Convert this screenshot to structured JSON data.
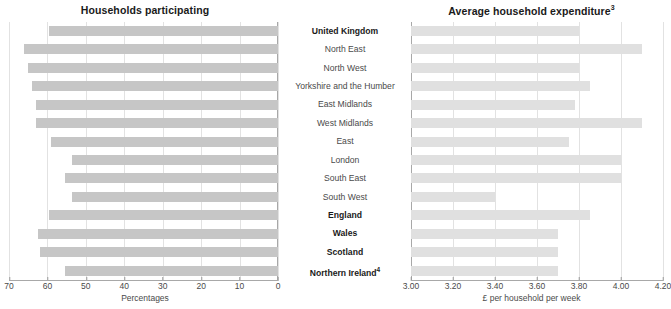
{
  "left_chart": {
    "title": "Households participating",
    "axis_caption": "Percentages",
    "ticks": [
      "70",
      "60",
      "50",
      "40",
      "30",
      "20",
      "10",
      "0"
    ]
  },
  "right_chart": {
    "title": "Average household expenditure",
    "title_sup": "3",
    "axis_caption": "£ per household per week",
    "ticks": [
      "3.00",
      "3.20",
      "3.40",
      "3.60",
      "3.80",
      "4.00",
      "4.20"
    ]
  },
  "categories": [
    {
      "label": "United Kingdom",
      "bold": true,
      "sup": ""
    },
    {
      "label": "North East",
      "bold": false,
      "sup": ""
    },
    {
      "label": "North West",
      "bold": false,
      "sup": ""
    },
    {
      "label": "Yorkshire and the Humber",
      "bold": false,
      "sup": ""
    },
    {
      "label": "East Midlands",
      "bold": false,
      "sup": ""
    },
    {
      "label": "West Midlands",
      "bold": false,
      "sup": ""
    },
    {
      "label": "East",
      "bold": false,
      "sup": ""
    },
    {
      "label": "London",
      "bold": false,
      "sup": ""
    },
    {
      "label": "South East",
      "bold": false,
      "sup": ""
    },
    {
      "label": "South West",
      "bold": false,
      "sup": ""
    },
    {
      "label": "England",
      "bold": true,
      "sup": ""
    },
    {
      "label": "Wales",
      "bold": true,
      "sup": ""
    },
    {
      "label": "Scotland",
      "bold": true,
      "sup": ""
    },
    {
      "label": "Northern Ireland",
      "bold": true,
      "sup": "4"
    }
  ],
  "chart_data": [
    {
      "type": "bar",
      "title": "Households participating",
      "orientation": "horizontal-reversed",
      "xlabel": "Percentages",
      "ylabel": "",
      "xlim": [
        70,
        0
      ],
      "xticks": [
        70,
        60,
        50,
        40,
        30,
        20,
        10,
        0
      ],
      "grid": true,
      "legend": "none",
      "categories": [
        "United Kingdom",
        "North East",
        "North West",
        "Yorkshire and the Humber",
        "East Midlands",
        "West Midlands",
        "East",
        "London",
        "South East",
        "South West",
        "England",
        "Wales",
        "Scotland",
        "Northern Ireland"
      ],
      "values": [
        59.6,
        66.0,
        65.0,
        64.0,
        63.0,
        63.0,
        59.0,
        53.5,
        55.5,
        53.5,
        59.5,
        62.5,
        62.0,
        55.5
      ]
    },
    {
      "type": "bar",
      "title": "Average household expenditure",
      "orientation": "horizontal",
      "xlabel": "£ per household per week",
      "ylabel": "",
      "xlim": [
        3.0,
        4.2
      ],
      "xticks": [
        3.0,
        3.2,
        3.4,
        3.6,
        3.8,
        4.0,
        4.2
      ],
      "grid": true,
      "legend": "none",
      "categories": [
        "United Kingdom",
        "North East",
        "North West",
        "Yorkshire and the Humber",
        "East Midlands",
        "West Midlands",
        "East",
        "London",
        "South East",
        "South West",
        "England",
        "Wales",
        "Scotland",
        "Northern Ireland"
      ],
      "values": [
        3.8,
        4.1,
        3.8,
        3.85,
        3.78,
        4.1,
        3.75,
        4.0,
        4.0,
        3.4,
        3.85,
        3.7,
        3.7,
        3.7
      ]
    }
  ]
}
